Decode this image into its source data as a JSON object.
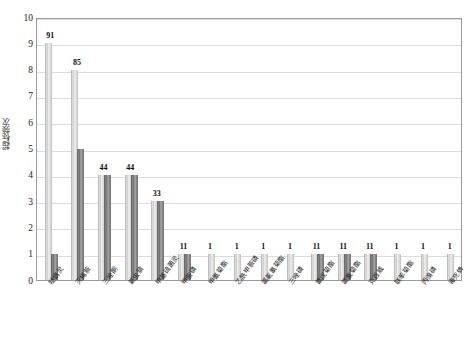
{
  "chart_data": {
    "type": "bar",
    "title": "",
    "subtitle": "",
    "xlabel": "",
    "ylabel": "超标频次",
    "ylim": [
      0,
      10
    ],
    "ytick_step": 1,
    "ytick_labels": [
      "0",
      "1",
      "2",
      "3",
      "4",
      "5",
      "6",
      "7",
      "8",
      "9",
      "10"
    ],
    "grid": true,
    "grid_axis": "y",
    "legend": false,
    "legend_position": "none",
    "categories": [
      "哒螨灵",
      "灭蝇胺",
      "三唑酮",
      "氟虫腈",
      "甲基硫菌灵",
      "甲胺磷",
      "甲氰菊酯",
      "乙酰甲胺磷",
      "氯氟氰菊酯",
      "三唑磷",
      "氰戊菊酯",
      "氯氰菊酯",
      "克百威",
      "联苯菊酯",
      "丙溴磷",
      "毒死蜱"
    ],
    "series": [
      {
        "name": "系列1",
        "color": "#d8d8d8",
        "values": [
          9,
          8,
          4,
          4,
          3,
          1,
          1,
          1,
          1,
          1,
          1,
          1,
          1,
          1,
          1,
          1
        ]
      },
      {
        "name": "系列2",
        "color": "#808080",
        "values": [
          1,
          5,
          4,
          4,
          3,
          1,
          null,
          null,
          null,
          null,
          1,
          1,
          1,
          null,
          null,
          null
        ]
      }
    ],
    "data_labels": [
      "9",
      "1",
      "8",
      "5",
      "44",
      "44",
      "33",
      "11",
      "1",
      "1",
      "1",
      "1",
      "11",
      "11",
      "11",
      "1",
      "1",
      "1"
    ],
    "group_labels": [
      [
        "9",
        "1"
      ],
      [
        "8",
        "5"
      ],
      [
        "44"
      ],
      [
        "44"
      ],
      [
        "33"
      ],
      [
        "11"
      ],
      [
        "1"
      ],
      [
        "1"
      ],
      [
        "1"
      ],
      [
        "1"
      ],
      [
        "11"
      ],
      [
        "11"
      ],
      [
        "11"
      ],
      [
        "1"
      ],
      [
        "1"
      ],
      [
        "1"
      ]
    ]
  }
}
